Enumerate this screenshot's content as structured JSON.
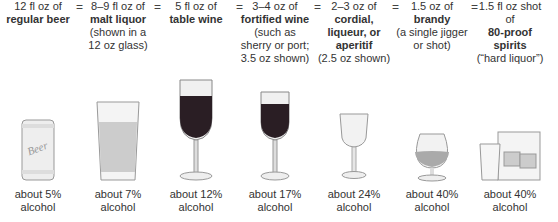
{
  "equals_sign": "=",
  "drinks": [
    {
      "lines": [
        {
          "t": "12 fl oz of",
          "b": false
        },
        {
          "t": "regular beer",
          "b": true
        }
      ],
      "icon": "beer-can-icon",
      "pct": "about 5%",
      "unit": "alcohol"
    },
    {
      "lines": [
        {
          "t": "8–9 fl oz of",
          "b": false
        },
        {
          "t": "malt liquor",
          "b": true
        },
        {
          "t": "(shown in a",
          "b": false
        },
        {
          "t": "12 oz glass)",
          "b": false
        }
      ],
      "icon": "malt-liquor-glass-icon",
      "pct": "about 7%",
      "unit": "alcohol"
    },
    {
      "lines": [
        {
          "t": "5 fl oz of",
          "b": false
        },
        {
          "t": "table wine",
          "b": true
        }
      ],
      "icon": "wine-glass-icon",
      "pct": "about 12%",
      "unit": "alcohol"
    },
    {
      "lines": [
        {
          "t": "3–4 oz of",
          "b": false
        },
        {
          "t": "fortified wine",
          "b": true
        },
        {
          "t": "(such as",
          "b": false
        },
        {
          "t": "sherry or port;",
          "b": false
        },
        {
          "t": "3.5 oz shown)",
          "b": false
        }
      ],
      "icon": "fortified-wine-glass-icon",
      "pct": "about 17%",
      "unit": "alcohol"
    },
    {
      "lines": [
        {
          "t": "2–3 oz of",
          "b": false
        },
        {
          "t": "cordial,",
          "b": true
        },
        {
          "t": "liqueur, or",
          "b": true
        },
        {
          "t": "aperitif",
          "b": true
        },
        {
          "t": "(2.5 oz shown)",
          "b": false
        }
      ],
      "icon": "cordial-glass-icon",
      "pct": "about 24%",
      "unit": "alcohol"
    },
    {
      "lines": [
        {
          "t": "1.5 oz of",
          "b": false
        },
        {
          "t": "brandy",
          "b": true
        },
        {
          "t": "(a single jigger",
          "b": false
        },
        {
          "t": "or shot)",
          "b": false
        }
      ],
      "icon": "brandy-snifter-icon",
      "pct": "about 40%",
      "unit": "alcohol"
    },
    {
      "lines": [
        {
          "t": "1.5 fl oz shot",
          "b": false
        },
        {
          "t": "of",
          "b": false
        },
        {
          "t": "80-proof",
          "b": true
        },
        {
          "t": "spirits",
          "b": true
        },
        {
          "t": "(“hard liquor”)",
          "b": false
        }
      ],
      "icon": "shot-and-rocks-glass-icon",
      "pct": "about 40%",
      "unit": "alcohol"
    }
  ],
  "colors": {
    "wine": "#2a1e24",
    "glass": "#e6e6e6",
    "outline": "#888888"
  }
}
